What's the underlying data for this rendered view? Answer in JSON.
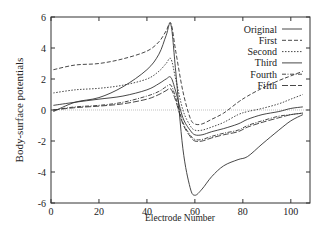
{
  "chart_data": {
    "type": "line",
    "title": "",
    "xlabel": "Electrode Number",
    "ylabel": "Body-surface potentials",
    "xlim": [
      0,
      108
    ],
    "ylim": [
      -6,
      6
    ],
    "xticks": [
      0,
      20,
      40,
      60,
      80,
      100
    ],
    "yticks": [
      -6,
      -4,
      -2,
      0,
      2,
      4,
      6
    ],
    "grid": false,
    "legend_position": "upper right",
    "zero_line": true,
    "series": [
      {
        "name": "Original",
        "style": "solid",
        "x": [
          1,
          10,
          20,
          30,
          40,
          45,
          48,
          50,
          52,
          55,
          58,
          60,
          63,
          67,
          72,
          78,
          82,
          88,
          95,
          100,
          105
        ],
        "y": [
          -0.1,
          0.5,
          0.8,
          1.5,
          2.6,
          3.6,
          4.8,
          5.5,
          2.5,
          -2.5,
          -5.0,
          -5.5,
          -5.1,
          -4.3,
          -3.6,
          -3.2,
          -3.0,
          -2.2,
          -1.3,
          -0.7,
          -0.3
        ]
      },
      {
        "name": "First",
        "style": "dashed",
        "x": [
          1,
          10,
          20,
          30,
          40,
          45,
          48,
          50,
          52,
          55,
          58,
          60,
          63,
          67,
          72,
          78,
          82,
          88,
          95,
          100,
          105
        ],
        "y": [
          2.6,
          2.9,
          3.0,
          3.3,
          3.8,
          4.4,
          5.1,
          5.6,
          3.8,
          1.2,
          -0.5,
          -0.9,
          -0.9,
          -0.6,
          -0.2,
          0.5,
          0.9,
          1.4,
          1.9,
          2.2,
          2.5
        ]
      },
      {
        "name": "Second",
        "style": "dotted",
        "x": [
          1,
          10,
          20,
          30,
          40,
          45,
          48,
          50,
          52,
          55,
          58,
          60,
          63,
          67,
          72,
          78,
          82,
          88,
          95,
          100,
          105
        ],
        "y": [
          1.1,
          1.3,
          1.4,
          1.6,
          2.0,
          2.5,
          3.0,
          3.3,
          2.0,
          0.0,
          -1.0,
          -1.3,
          -1.3,
          -1.1,
          -0.8,
          -0.3,
          -0.1,
          0.1,
          0.4,
          0.7,
          1.0
        ]
      },
      {
        "name": "Third",
        "style": "solid",
        "x": [
          1,
          10,
          20,
          30,
          40,
          45,
          48,
          50,
          52,
          55,
          58,
          60,
          63,
          67,
          72,
          78,
          82,
          88,
          95,
          100,
          105
        ],
        "y": [
          0.3,
          0.5,
          0.7,
          0.9,
          1.3,
          1.7,
          2.0,
          2.1,
          1.2,
          -0.5,
          -1.3,
          -1.6,
          -1.6,
          -1.4,
          -1.2,
          -0.9,
          -0.6,
          -0.3,
          -0.1,
          0.1,
          0.2
        ]
      },
      {
        "name": "Fourth",
        "style": "dashdot",
        "x": [
          1,
          10,
          20,
          30,
          40,
          45,
          48,
          50,
          52,
          55,
          58,
          60,
          63,
          67,
          72,
          78,
          82,
          88,
          95,
          100,
          105
        ],
        "y": [
          0.0,
          0.2,
          0.3,
          0.5,
          0.9,
          1.2,
          1.5,
          1.6,
          0.8,
          -0.8,
          -1.6,
          -1.9,
          -1.9,
          -1.7,
          -1.5,
          -1.3,
          -1.0,
          -0.7,
          -0.4,
          -0.3,
          -0.2
        ]
      },
      {
        "name": "Fifth",
        "style": "longdash",
        "x": [
          1,
          10,
          20,
          30,
          40,
          45,
          48,
          50,
          52,
          55,
          58,
          60,
          63,
          67,
          72,
          78,
          82,
          88,
          95,
          100,
          105
        ],
        "y": [
          0.0,
          0.15,
          0.25,
          0.4,
          0.7,
          1.0,
          1.25,
          1.35,
          0.6,
          -0.9,
          -1.7,
          -2.0,
          -2.0,
          -1.8,
          -1.6,
          -1.4,
          -1.1,
          -0.8,
          -0.5,
          -0.3,
          -0.2
        ]
      }
    ]
  }
}
